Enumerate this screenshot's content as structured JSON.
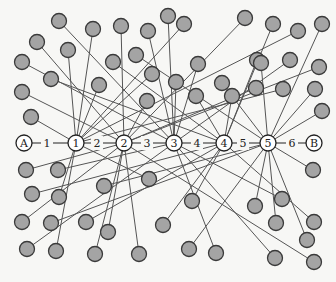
{
  "diagram": {
    "type": "network-graph",
    "width": 336,
    "height": 282,
    "colors": {
      "background": "#f7f7f5",
      "node_fill": "#a4a4a4",
      "node_stroke": "#3a3a3a",
      "edge": "#555555",
      "chain_node_fill": "#ffffff",
      "text": "#222222"
    },
    "node_radius": 7.5,
    "chain_node_radius": 8,
    "chain": {
      "y": 143,
      "nodes": [
        {
          "id": "A",
          "label": "A",
          "x": 24
        },
        {
          "id": "1",
          "label": "1",
          "x": 76
        },
        {
          "id": "2",
          "label": "2",
          "x": 124
        },
        {
          "id": "3",
          "label": "3",
          "x": 174
        },
        {
          "id": "4",
          "label": "4",
          "x": 224
        },
        {
          "id": "5",
          "label": "5",
          "x": 268
        },
        {
          "id": "B",
          "label": "B",
          "x": 314
        }
      ],
      "edges": [
        {
          "from": "A",
          "to": "1",
          "label": "1",
          "lx": 47
        },
        {
          "from": "1",
          "to": "2",
          "label": "2",
          "lx": 97
        },
        {
          "from": "2",
          "to": "3",
          "label": "3",
          "lx": 147
        },
        {
          "from": "3",
          "to": "4",
          "label": "4",
          "lx": 197
        },
        {
          "from": "4",
          "to": "5",
          "label": "5",
          "lx": 243
        },
        {
          "from": "5",
          "to": "B",
          "label": "6",
          "lx": 292
        }
      ]
    },
    "gray_nodes": [
      {
        "x": 59,
        "y": 21,
        "hub": "3"
      },
      {
        "x": 93,
        "y": 29,
        "hub": "1"
      },
      {
        "x": 121,
        "y": 26,
        "hub": "2"
      },
      {
        "x": 148,
        "y": 31,
        "hub": "3"
      },
      {
        "x": 184,
        "y": 24,
        "hub": "1"
      },
      {
        "x": 245,
        "y": 18,
        "hub": "2"
      },
      {
        "x": 273,
        "y": 24,
        "hub": "4"
      },
      {
        "x": 298,
        "y": 31,
        "hub": "1"
      },
      {
        "x": 322,
        "y": 24,
        "hub": "5"
      },
      {
        "x": 37,
        "y": 42,
        "hub": "2"
      },
      {
        "x": 68,
        "y": 50,
        "hub": "1"
      },
      {
        "x": 113,
        "y": 62,
        "hub": "4"
      },
      {
        "x": 136,
        "y": 55,
        "hub": "5"
      },
      {
        "x": 152,
        "y": 74,
        "hub": "1"
      },
      {
        "x": 198,
        "y": 64,
        "hub": "3"
      },
      {
        "x": 168,
        "y": 16,
        "hub": "3"
      },
      {
        "x": 222,
        "y": 83,
        "hub": "5"
      },
      {
        "x": 257,
        "y": 60,
        "hub": "4"
      },
      {
        "x": 290,
        "y": 60,
        "hub": "3"
      },
      {
        "x": 319,
        "y": 67,
        "hub": "2"
      },
      {
        "x": 22,
        "y": 62,
        "hub": "3"
      },
      {
        "x": 51,
        "y": 79,
        "hub": "4"
      },
      {
        "x": 99,
        "y": 85,
        "hub": "1"
      },
      {
        "x": 147,
        "y": 101,
        "hub": "2"
      },
      {
        "x": 176,
        "y": 82,
        "hub": "3"
      },
      {
        "x": 232,
        "y": 96,
        "hub": "4"
      },
      {
        "x": 256,
        "y": 88,
        "hub": "2"
      },
      {
        "x": 283,
        "y": 89,
        "hub": "1"
      },
      {
        "x": 315,
        "y": 89,
        "hub": "5"
      },
      {
        "x": 22,
        "y": 92,
        "hub": "2"
      },
      {
        "x": 31,
        "y": 117,
        "hub": "1"
      },
      {
        "x": 196,
        "y": 96,
        "hub": "4"
      },
      {
        "x": 261,
        "y": 63,
        "hub": "5"
      },
      {
        "x": 322,
        "y": 111,
        "hub": "5"
      },
      {
        "x": 26,
        "y": 170,
        "hub": "2"
      },
      {
        "x": 58,
        "y": 170,
        "hub": "3"
      },
      {
        "x": 104,
        "y": 186,
        "hub": "5"
      },
      {
        "x": 149,
        "y": 179,
        "hub": "1"
      },
      {
        "x": 32,
        "y": 194,
        "hub": "4"
      },
      {
        "x": 59,
        "y": 197,
        "hub": "1"
      },
      {
        "x": 192,
        "y": 201,
        "hub": "4"
      },
      {
        "x": 282,
        "y": 199,
        "hub": "3"
      },
      {
        "x": 313,
        "y": 170,
        "hub": "5"
      },
      {
        "x": 22,
        "y": 222,
        "hub": "2"
      },
      {
        "x": 51,
        "y": 223,
        "hub": "5"
      },
      {
        "x": 86,
        "y": 222,
        "hub": "4"
      },
      {
        "x": 108,
        "y": 232,
        "hub": "2"
      },
      {
        "x": 163,
        "y": 225,
        "hub": "4"
      },
      {
        "x": 255,
        "y": 206,
        "hub": "5"
      },
      {
        "x": 276,
        "y": 223,
        "hub": "5"
      },
      {
        "x": 314,
        "y": 222,
        "hub": "4"
      },
      {
        "x": 27,
        "y": 249,
        "hub": "3"
      },
      {
        "x": 56,
        "y": 251,
        "hub": "1"
      },
      {
        "x": 95,
        "y": 254,
        "hub": "2"
      },
      {
        "x": 139,
        "y": 254,
        "hub": "2"
      },
      {
        "x": 189,
        "y": 249,
        "hub": "5"
      },
      {
        "x": 216,
        "y": 253,
        "hub": "3"
      },
      {
        "x": 275,
        "y": 258,
        "hub": "3"
      },
      {
        "x": 307,
        "y": 240,
        "hub": "5"
      },
      {
        "x": 314,
        "y": 262,
        "hub": "2"
      }
    ]
  }
}
